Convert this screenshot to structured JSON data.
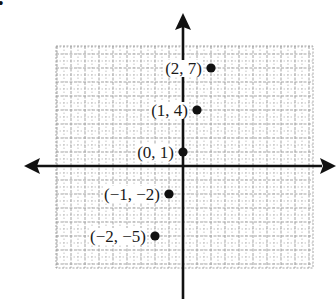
{
  "chart_data": {
    "type": "scatter",
    "title": "",
    "xlabel": "",
    "ylabel": "",
    "grid": true,
    "legend": null,
    "xlim": [
      -9,
      9
    ],
    "ylim": [
      -7,
      8.5
    ],
    "points": [
      {
        "x": 2,
        "y": 7,
        "label": "(2, 7)"
      },
      {
        "x": 1,
        "y": 4,
        "label": "(1, 4)"
      },
      {
        "x": 0,
        "y": 1,
        "label": "(0, 1)"
      },
      {
        "x": -1,
        "y": -2,
        "label": "(−1, −2)"
      },
      {
        "x": -2,
        "y": -5,
        "label": "(−2, −5)"
      }
    ]
  },
  "layout": {
    "origin_px": [
      183,
      166
    ],
    "unit_px": 14,
    "grid_box": {
      "left": 56,
      "top": 46,
      "right": 313,
      "bottom": 268
    },
    "colors": {
      "axis": "#111111",
      "grid": "#9a9a9a",
      "point": "#111111",
      "text": "#1a1a1a"
    }
  },
  "corner_mark": "•"
}
